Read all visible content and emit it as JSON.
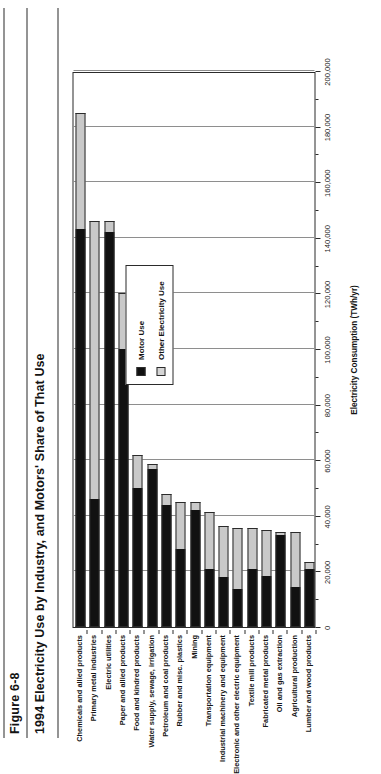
{
  "figure": {
    "number": "Figure 6-8",
    "title": "1994 Electricity Use by Industry, and Motors' Share of That Use"
  },
  "legend": {
    "motor_label": "Motor Use",
    "other_label": "Other Electricity Use",
    "motor_color": "#111111",
    "other_color": "#d5d5d5",
    "position": "inside-right"
  },
  "chart_data": {
    "type": "bar",
    "orientation": "horizontal",
    "stacked": true,
    "title": "1994 Electricity Use by Industry, and Motors' Share of That Use",
    "xlabel": "Electricity Consumption (TWh/yr)",
    "ylabel": "",
    "xlim": [
      0,
      200000
    ],
    "xticks": [
      0,
      20000,
      40000,
      60000,
      80000,
      100000,
      120000,
      140000,
      160000,
      180000,
      200000
    ],
    "xticklabels": [
      "0",
      "20,000",
      "40,000",
      "60,000",
      "80,000",
      "100,000",
      "120,000",
      "140,000",
      "160,000",
      "180,000",
      "200,000"
    ],
    "grid": true,
    "categories": [
      "Chemicals and allied products",
      "Primary metal industries",
      "Electric utilities",
      "Paper and allied products",
      "Food and kindred products",
      "Water supply, sewage, irrigation",
      "Petroleum and coal products",
      "Rubber and misc. plastics",
      "Mining",
      "Transportation equipment",
      "Industrial machinery and equipment",
      "Electronic and other electric equipment",
      "Textile mill products",
      "Fabricated metal products",
      "Oil and gas extraction",
      "Agricultural production",
      "Lumber and wood products"
    ],
    "series": [
      {
        "name": "Motor Use",
        "color": "#111111",
        "values": [
          143000,
          46000,
          142000,
          100000,
          50000,
          57000,
          44000,
          28000,
          42000,
          21000,
          18000,
          13500,
          21000,
          18500,
          33000,
          14500,
          21000
        ]
      },
      {
        "name": "Other Electricity Use",
        "color": "#d5d5d5",
        "values": [
          42000,
          100000,
          4000,
          20000,
          12000,
          1500,
          4000,
          17000,
          3000,
          20500,
          18500,
          22000,
          14500,
          16500,
          1000,
          19500,
          2500
        ]
      }
    ],
    "totals": [
      185000,
      146000,
      146000,
      120000,
      62000,
      58500,
      48000,
      45000,
      45000,
      41500,
      36500,
      35500,
      35500,
      35000,
      34000,
      34000,
      23500
    ]
  }
}
